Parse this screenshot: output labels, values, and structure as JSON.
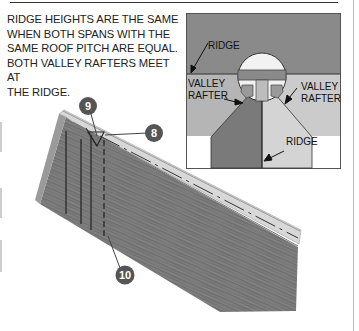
{
  "caption": {
    "lines": [
      "RIDGE HEIGHTS ARE THE SAME",
      "WHEN BOTH SPANS WITH THE",
      "SAME ROOF PITCH ARE EQUAL.",
      "BOTH VALLEY RAFTERS MEET AT",
      "THE RIDGE."
    ]
  },
  "inset": {
    "labels": {
      "ridge_top": "RIDGE",
      "valley_rafter_left_1": "VALLEY",
      "valley_rafter_left_2": "RAFTER",
      "valley_rafter_right_1": "VALLEY",
      "valley_rafter_right_2": "RAFTER",
      "ridge_bottom": "RIDGE"
    },
    "colors": {
      "upper_roof": "#8a8a8a",
      "lower_left_roof": "#b9b9b9",
      "lower_right_roof": "#cfcfcf",
      "left_wing": "#7d7d7d",
      "right_wing": "#d6d6d6",
      "detail_circle": "#f2f2f2"
    }
  },
  "callouts": [
    {
      "id": "callout-9",
      "number": "9"
    },
    {
      "id": "callout-8",
      "number": "8"
    },
    {
      "id": "callout-10",
      "number": "10"
    }
  ],
  "colors": {
    "callout_fill": "#555555",
    "rafter_face": "#7a7a7a",
    "rafter_top": "#d4d4d4",
    "line_dark": "#222222"
  }
}
